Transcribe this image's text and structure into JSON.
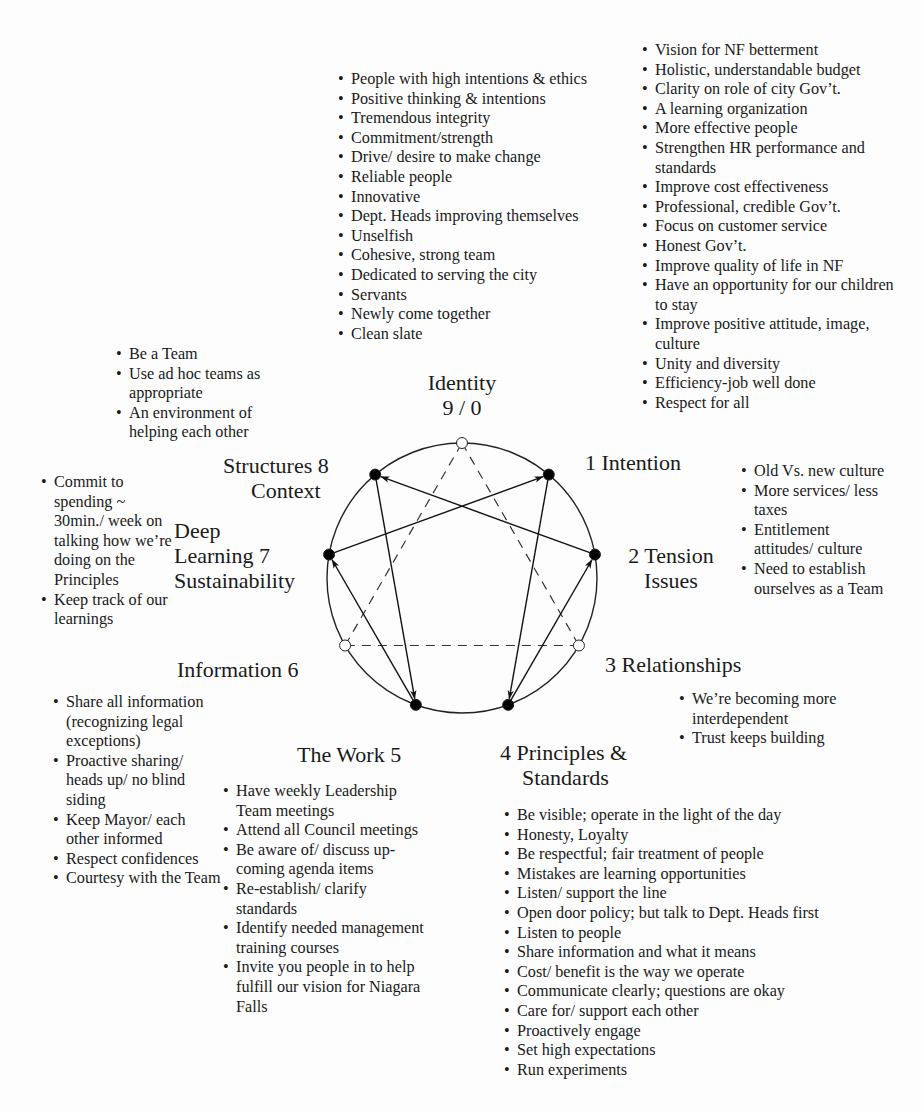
{
  "diagram": {
    "type": "enneagram",
    "nodes": [
      {
        "id": "9",
        "label_lines": [
          "Identity",
          "9 / 0"
        ],
        "filled": false
      },
      {
        "id": "1",
        "label_lines": [
          "1 Intention"
        ],
        "filled": true
      },
      {
        "id": "2",
        "label_lines": [
          "2 Tension",
          "Issues"
        ],
        "filled": true
      },
      {
        "id": "3",
        "label_lines": [
          "3 Relationships"
        ],
        "filled": false
      },
      {
        "id": "4",
        "label_lines": [
          "4 Principles &",
          "Standards"
        ],
        "filled": true
      },
      {
        "id": "5",
        "label_lines": [
          "The Work 5"
        ],
        "filled": true
      },
      {
        "id": "6",
        "label_lines": [
          "Information 6"
        ],
        "filled": false
      },
      {
        "id": "7",
        "label_lines": [
          "Deep",
          "Learning 7",
          "Sustainability"
        ],
        "filled": true
      },
      {
        "id": "8",
        "label_lines": [
          "Structures 8",
          "Context"
        ],
        "filled": true
      }
    ],
    "arrows": [
      {
        "from": "1",
        "to": "4"
      },
      {
        "from": "4",
        "to": "2"
      },
      {
        "from": "2",
        "to": "8"
      },
      {
        "from": "8",
        "to": "5"
      },
      {
        "from": "5",
        "to": "7"
      },
      {
        "from": "7",
        "to": "1"
      }
    ],
    "dashed_edges": [
      {
        "from": "9",
        "to": "3"
      },
      {
        "from": "3",
        "to": "6"
      },
      {
        "from": "6",
        "to": "9"
      }
    ]
  },
  "notes": {
    "identity": [
      "People with high intentions & ethics",
      "Positive thinking  & intentions",
      "Tremendous integrity",
      "Commitment/strength",
      "Drive/ desire to make change",
      "Reliable people",
      "Innovative",
      "Dept. Heads improving themselves",
      "Unselfish",
      "Cohesive, strong team",
      "Dedicated to serving the city",
      "Servants",
      "Newly come together",
      "Clean slate"
    ],
    "intention": [
      "Vision for NF betterment",
      "Holistic, understandable budget",
      "Clarity on role of city Gov’t.",
      "A learning organization",
      "More effective people",
      "Strengthen HR performance and standards",
      "Improve cost effectiveness",
      "Professional, credible Gov’t.",
      "Focus on customer service",
      "Honest Gov’t.",
      "Improve quality of life in NF",
      "Have an opportunity for our children to stay",
      "Improve positive attitude, image, culture",
      "Unity and diversity",
      "Efficiency-job well done",
      "Respect for all"
    ],
    "structures": [
      "Be a Team",
      "Use ad hoc teams as appropriate",
      "An environment of helping each other"
    ],
    "deep_learning": [
      "Commit to spending ~ 30min./ week on talking how we’re doing on the Principles",
      "Keep track of our learnings"
    ],
    "tension": [
      "Old Vs. new culture",
      "More services/ less taxes",
      "Entitlement attitudes/ culture",
      "Need to establish ourselves as a Team"
    ],
    "relationships": [
      "We’re becoming more interdependent",
      "Trust keeps building"
    ],
    "information": [
      "Share all information (recognizing legal exceptions)",
      "Proactive sharing/ heads up/ no blind siding",
      "Keep Mayor/ each other informed",
      "Respect confidences",
      "Courtesy with the Team"
    ],
    "the_work": [
      "Have weekly Leadership Team meetings",
      "Attend all Council meetings",
      "Be aware of/ discuss up-coming agenda items",
      "Re-establish/ clarify standards",
      "Identify needed management training courses",
      "Invite you people in to help fulfill our vision for Niagara Falls"
    ],
    "principles": [
      "Be visible; operate in the light of the day",
      "Honesty, Loyalty",
      "Be respectful; fair treatment of people",
      "Mistakes are learning opportunities",
      "Listen/ support the line",
      "Open door policy; but talk to Dept. Heads first",
      "Listen to people",
      "Share information and what it means",
      "Cost/ benefit is the way we operate",
      "Communicate clearly; questions are okay",
      "Care for/ support each other",
      "Proactively engage",
      "Set high expectations",
      "Run experiments"
    ]
  }
}
